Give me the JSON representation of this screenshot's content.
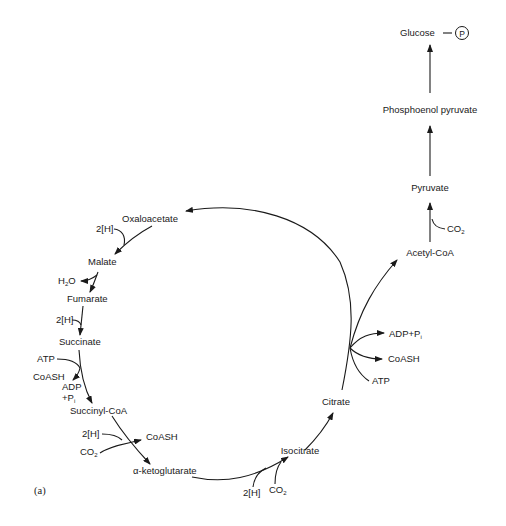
{
  "figure": {
    "panel_label": "(a)",
    "gluconeogenesis": {
      "glucose": "Glucose",
      "phosphate_symbol": "P",
      "pep": "Phosphoenol pyruvate",
      "pyruvate": "Pyruvate",
      "acetyl_coa": "Acetyl-CoA",
      "co2": "CO",
      "co2_sub": "2"
    },
    "cycle": {
      "oxaloacetate": "Oxaloacetate",
      "malate": "Malate",
      "fumarate": "Fumarate",
      "succinate": "Succinate",
      "succinyl_coa": "Succinyl-CoA",
      "alpha_ketoglutarate": "α-ketoglutarate",
      "isocitrate": "Isocitrate",
      "citrate": "Citrate"
    },
    "cofactors": {
      "h2_malate": "2[H]",
      "h2o_h": "H",
      "h2o_sub": "2",
      "h2o_o": "O",
      "h2_fumarate": "2[H]",
      "atp_succ": "ATP",
      "coash_succ": "CoASH",
      "adp_succ": "ADP",
      "pi_succ": "+P",
      "pi_sub": "i",
      "h2_akg": "2[H]",
      "co2_akg": "CO",
      "co2_akg_sub": "2",
      "coash_akg": "CoASH",
      "h2_iso": "2[H]",
      "co2_iso": "CO",
      "co2_iso_sub": "2",
      "adp_pi_citrate": "ADP+P",
      "adp_pi_sub": "i",
      "coash_citrate": "CoASH",
      "atp_citrate": "ATP"
    }
  }
}
